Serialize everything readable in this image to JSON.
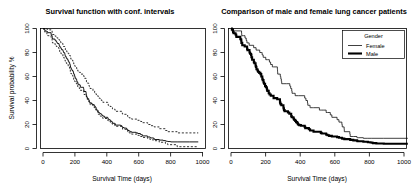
{
  "figure": {
    "layout": "two-panel-row",
    "background_color": "#ffffff",
    "foreground_color": "#000000"
  },
  "panels": [
    {
      "id": "survival-ci",
      "title": "Survival function with conf. intervals",
      "xlabel": "Survival Time (days)",
      "ylabel": "Survival probability %",
      "xticks": [
        "0",
        "200",
        "400",
        "600",
        "800",
        "1000"
      ],
      "yticks": [
        "0",
        "20",
        "40",
        "60",
        "80",
        "100"
      ]
    },
    {
      "id": "gender-comparison",
      "title": "Comparison of male and female lung cancer patients",
      "xlabel": "Survival Time (days)",
      "ylabel": "",
      "xticks": [
        "0",
        "200",
        "400",
        "600",
        "800",
        "1000"
      ],
      "yticks": [
        "0",
        "20",
        "40",
        "60",
        "80",
        "100"
      ],
      "legend": {
        "title": "Gender",
        "entries": [
          {
            "label": "Female",
            "style": "thin-line",
            "color": "#000000"
          },
          {
            "label": "Male",
            "style": "thick-line",
            "color": "#000000"
          }
        ]
      }
    }
  ],
  "chart_data": [
    {
      "type": "line",
      "id": "survival-ci",
      "title": "Survival function with conf. intervals",
      "xlabel": "Survival Time (days)",
      "ylabel": "Survival probability %",
      "xlim": [
        0,
        1050
      ],
      "ylim": [
        0,
        100
      ],
      "grid": false,
      "legend_position": "none",
      "xticks": [
        0,
        200,
        400,
        600,
        800,
        1000
      ],
      "yticks": [
        0,
        20,
        40,
        60,
        80,
        100
      ],
      "series": [
        {
          "name": "Survival estimate",
          "style": "solid",
          "x": [
            0,
            5,
            11,
            12,
            13,
            15,
            26,
            30,
            31,
            53,
            54,
            59,
            60,
            61,
            62,
            65,
            79,
            81,
            88,
            92,
            93,
            95,
            105,
            107,
            110,
            116,
            118,
            122,
            131,
            132,
            135,
            142,
            144,
            145,
            147,
            153,
            156,
            163,
            166,
            170,
            175,
            177,
            180,
            181,
            183,
            186,
            188,
            191,
            197,
            201,
            202,
            207,
            208,
            210,
            212,
            218,
            222,
            223,
            229,
            230,
            239,
            245,
            246,
            267,
            268,
            269,
            270,
            283,
            284,
            285,
            286,
            288,
            291,
            293,
            301,
            303,
            305,
            306,
            310,
            320,
            329,
            337,
            340,
            345,
            348,
            350,
            351,
            353,
            361,
            363,
            364,
            371,
            376,
            383,
            387,
            390,
            394,
            404,
            426,
            428,
            429,
            433,
            442,
            444,
            450,
            455,
            457,
            460,
            473,
            477,
            477,
            511,
            519,
            520,
            524,
            533,
            550,
            551,
            558,
            559,
            567,
            574,
            583,
            613,
            624,
            641,
            643,
            654,
            655,
            687,
            689,
            705,
            707,
            728,
            731,
            735,
            765,
            791,
            806,
            814,
            821,
            840,
            883,
            965,
            1022
          ],
          "y": [
            100,
            99.6,
            99.1,
            98.7,
            98.2,
            97.8,
            97.4,
            96.9,
            96.5,
            95.6,
            94.3,
            93.9,
            93.4,
            92.5,
            91.6,
            91.2,
            90.3,
            89.8,
            88.9,
            88.4,
            87.9,
            87.5,
            86.6,
            85.6,
            84.7,
            84.2,
            83.3,
            82.3,
            81.8,
            80.9,
            79.9,
            79.4,
            78.5,
            77.5,
            76.6,
            75.6,
            74.7,
            73.7,
            72.7,
            71.8,
            70.8,
            69.8,
            68.9,
            67.9,
            67.0,
            66.5,
            66.0,
            65.0,
            64.0,
            63.0,
            62.0,
            61.5,
            60.5,
            59.5,
            58.5,
            57.5,
            56.5,
            55.5,
            54.5,
            53.5,
            53.0,
            52.0,
            51.0,
            50.0,
            49.5,
            48.5,
            47.5,
            46.5,
            45.5,
            44.5,
            44.0,
            43.0,
            42.5,
            41.5,
            40.5,
            40.0,
            39.0,
            38.5,
            38.0,
            37.0,
            36.5,
            36.0,
            35.0,
            34.5,
            34.0,
            33.0,
            32.5,
            32.0,
            31.5,
            31.0,
            30.0,
            29.5,
            29.0,
            28.5,
            28.0,
            27.5,
            27.0,
            26.0,
            25.5,
            25.0,
            24.5,
            24.0,
            23.5,
            23.0,
            22.5,
            22.0,
            21.5,
            21.0,
            20.5,
            20.0,
            19.5,
            19.0,
            18.5,
            18.0,
            17.5,
            17.0,
            16.5,
            16.0,
            15.5,
            15.0,
            14.5,
            14.0,
            13.5,
            13.0,
            12.5,
            12.0,
            11.5,
            11.0,
            10.5,
            10.0,
            9.6,
            9.2,
            8.8,
            8.4,
            8.0,
            7.5,
            7.0,
            6.6,
            6.2,
            6.0,
            5.8,
            5.5,
            5.5,
            5.5
          ]
        },
        {
          "name": "Upper 95% CI",
          "style": "dashed",
          "x": [
            0,
            5,
            11,
            13,
            26,
            31,
            53,
            60,
            62,
            79,
            88,
            93,
            105,
            110,
            118,
            131,
            135,
            144,
            147,
            156,
            166,
            175,
            180,
            183,
            188,
            197,
            202,
            208,
            212,
            222,
            229,
            239,
            246,
            268,
            270,
            284,
            286,
            291,
            301,
            305,
            310,
            329,
            340,
            348,
            351,
            361,
            364,
            376,
            387,
            394,
            426,
            429,
            442,
            450,
            457,
            473,
            477,
            519,
            524,
            550,
            558,
            567,
            583,
            624,
            643,
            655,
            689,
            707,
            731,
            765,
            806,
            821,
            883,
            1022
          ],
          "y": [
            100,
            100,
            100,
            99.8,
            99.3,
            98.9,
            98.0,
            96.5,
            95.0,
            93.6,
            92.5,
            92.0,
            90.5,
            89.0,
            87.6,
            86.2,
            85.0,
            83.5,
            82.0,
            80.6,
            79.0,
            77.5,
            76.0,
            74.5,
            73.5,
            72.0,
            70.5,
            69.0,
            67.5,
            66.0,
            64.5,
            63.5,
            62.0,
            60.5,
            58.5,
            57.0,
            55.5,
            54.5,
            52.5,
            51.5,
            50.0,
            48.0,
            46.5,
            45.5,
            44.5,
            43.5,
            42.0,
            40.5,
            39.5,
            38.5,
            37.0,
            36.0,
            35.0,
            34.0,
            33.0,
            32.0,
            31.0,
            29.5,
            28.5,
            27.5,
            26.5,
            25.5,
            24.5,
            23.5,
            22.5,
            21.5,
            20.0,
            19.0,
            18.0,
            16.5,
            15.0,
            14.0,
            13.0,
            13.0
          ]
        },
        {
          "name": "Lower 95% CI",
          "style": "dashed",
          "x": [
            0,
            5,
            11,
            13,
            26,
            31,
            53,
            60,
            62,
            79,
            88,
            93,
            105,
            110,
            118,
            131,
            135,
            144,
            147,
            156,
            166,
            175,
            180,
            183,
            188,
            197,
            202,
            208,
            212,
            222,
            229,
            239,
            246,
            268,
            270,
            284,
            286,
            291,
            301,
            305,
            310,
            329,
            340,
            348,
            351,
            361,
            364,
            376,
            387,
            394,
            426,
            429,
            442,
            450,
            457,
            473,
            477,
            519,
            524,
            550,
            558,
            567,
            583,
            624,
            643,
            655,
            689,
            707,
            731,
            765,
            806,
            821,
            883,
            1022
          ],
          "y": [
            100,
            98.6,
            97.5,
            96.5,
            95.0,
            94.0,
            92.5,
            90.0,
            88.0,
            86.5,
            85.0,
            84.0,
            82.0,
            80.5,
            79.0,
            77.0,
            75.5,
            73.5,
            71.5,
            70.0,
            68.0,
            66.0,
            64.0,
            62.5,
            61.0,
            59.0,
            57.5,
            56.0,
            54.5,
            53.0,
            51.0,
            50.0,
            48.5,
            47.0,
            45.0,
            43.5,
            42.0,
            41.0,
            39.0,
            38.0,
            36.5,
            34.5,
            33.0,
            32.0,
            31.0,
            30.0,
            28.5,
            27.0,
            26.0,
            25.0,
            23.5,
            23.0,
            22.0,
            21.0,
            20.0,
            19.0,
            18.5,
            17.0,
            16.0,
            15.0,
            14.0,
            13.0,
            12.0,
            11.0,
            10.0,
            9.2,
            8.0,
            7.2,
            6.5,
            5.2,
            4.0,
            3.2,
            1.5,
            1.5
          ]
        }
      ]
    },
    {
      "type": "line",
      "id": "gender-comparison",
      "title": "Comparison of male and female lung cancer patients",
      "xlabel": "Survival Time (days)",
      "ylabel": "",
      "xlim": [
        0,
        1050
      ],
      "ylim": [
        0,
        100
      ],
      "grid": false,
      "legend_position": "top-right",
      "legend_title": "Gender",
      "xticks": [
        0,
        200,
        400,
        600,
        800,
        1000
      ],
      "yticks": [
        0,
        20,
        40,
        60,
        80,
        100
      ],
      "series": [
        {
          "name": "Female",
          "style": "thin-line",
          "x": [
            0,
            5,
            13,
            53,
            61,
            62,
            71,
            81,
            88,
            92,
            105,
            131,
            145,
            166,
            177,
            180,
            186,
            201,
            212,
            222,
            229,
            239,
            245,
            268,
            269,
            270,
            285,
            286,
            288,
            291,
            293,
            301,
            320,
            340,
            345,
            350,
            351,
            353,
            363,
            371,
            390,
            426,
            428,
            429,
            433,
            442,
            444,
            450,
            455,
            457,
            460,
            473,
            477,
            511,
            519,
            520,
            524,
            533,
            550,
            558,
            559,
            567,
            574,
            583,
            613,
            624,
            641,
            643,
            654,
            655,
            687,
            689,
            705,
            707,
            728,
            731,
            735,
            765,
            791,
            814,
            883,
            1022
          ],
          "y": [
            100,
            100,
            98.0,
            98.0,
            96.0,
            94.0,
            94.0,
            92.0,
            90.0,
            88.0,
            86.0,
            84.0,
            82.0,
            80.0,
            80.0,
            78.0,
            76.0,
            74.0,
            74.0,
            72.0,
            70.0,
            68.0,
            68.0,
            66.0,
            64.0,
            62.0,
            60.0,
            60.0,
            58.0,
            56.0,
            54.0,
            54.0,
            54.0,
            52.0,
            50.0,
            50.0,
            48.0,
            46.0,
            46.0,
            44.0,
            44.0,
            42.0,
            42.0,
            42.0,
            40.0,
            38.0,
            36.0,
            36.0,
            36.0,
            34.0,
            34.0,
            34.0,
            34.0,
            32.0,
            32.0,
            32.0,
            32.0,
            32.0,
            30.0,
            30.0,
            30.0,
            30.0,
            28.0,
            26.0,
            24.0,
            22.0,
            20.0,
            18.0,
            16.0,
            14.0,
            12.0,
            10.0,
            10.0,
            10.0,
            9.0,
            9.0,
            9.0,
            8.5,
            8.5,
            8.5,
            8.5,
            8.5
          ]
        },
        {
          "name": "Male",
          "style": "thick-line",
          "x": [
            0,
            5,
            11,
            12,
            15,
            26,
            30,
            31,
            54,
            59,
            60,
            65,
            79,
            93,
            95,
            107,
            110,
            116,
            118,
            122,
            132,
            135,
            142,
            144,
            147,
            153,
            156,
            163,
            170,
            175,
            181,
            183,
            188,
            191,
            197,
            202,
            207,
            208,
            210,
            218,
            223,
            230,
            246,
            267,
            283,
            284,
            286,
            291,
            303,
            305,
            306,
            310,
            329,
            337,
            348,
            351,
            361,
            364,
            371,
            376,
            383,
            387,
            394,
            404,
            426,
            429,
            450,
            457,
            477,
            519,
            524,
            550,
            551,
            558,
            567,
            583,
            613,
            624,
            641,
            643,
            655,
            689,
            707,
            728,
            731,
            765,
            791,
            806,
            814,
            821,
            840,
            883,
            965,
            1022
          ],
          "y": [
            100,
            99.0,
            98.0,
            97.0,
            96.0,
            95.0,
            94.0,
            93.0,
            91.0,
            90.0,
            88.0,
            86.0,
            85.0,
            83.0,
            82.0,
            80.0,
            79.0,
            78.0,
            76.0,
            74.0,
            72.0,
            71.0,
            69.0,
            68.0,
            66.0,
            65.0,
            64.0,
            63.0,
            62.0,
            60.0,
            58.0,
            57.0,
            55.0,
            54.0,
            52.0,
            51.0,
            50.0,
            49.0,
            48.0,
            46.0,
            45.0,
            44.0,
            42.0,
            41.0,
            39.0,
            38.0,
            37.0,
            36.0,
            34.0,
            33.0,
            32.0,
            31.0,
            30.0,
            29.0,
            27.0,
            26.0,
            25.0,
            24.0,
            23.0,
            22.0,
            21.0,
            20.0,
            19.5,
            19.0,
            18.0,
            17.0,
            16.0,
            15.0,
            14.0,
            13.0,
            12.5,
            12.0,
            11.5,
            11.0,
            10.5,
            10.0,
            9.5,
            9.0,
            8.6,
            8.2,
            7.8,
            7.2,
            6.8,
            6.4,
            6.0,
            5.6,
            5.2,
            5.0,
            4.8,
            4.5,
            4.2,
            4.0,
            4.0,
            4.0
          ]
        }
      ]
    }
  ]
}
